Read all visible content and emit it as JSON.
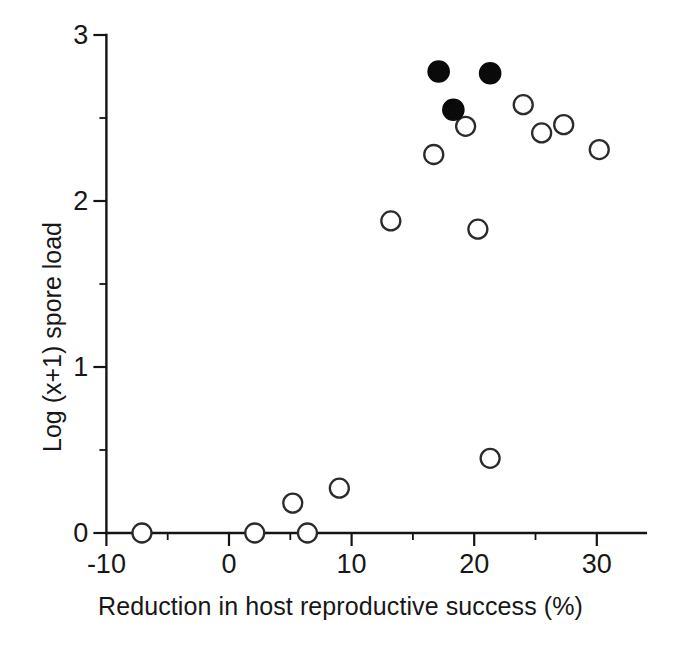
{
  "chart_data": {
    "type": "scatter",
    "title": "",
    "xlabel": "Reduction in host reproductive success (%)",
    "ylabel": "Log (x+1) spore load",
    "xlim": [
      -10,
      34
    ],
    "ylim": [
      0,
      3
    ],
    "xticks": [
      -10,
      0,
      10,
      20,
      30
    ],
    "xtick_labels": [
      "-10",
      "0",
      "10",
      "20",
      "30"
    ],
    "yticks": [
      0,
      1,
      2,
      3
    ],
    "ytick_labels": [
      "0",
      "1",
      "2",
      "3"
    ],
    "x_minor_ticks": [
      -5,
      5,
      15,
      25
    ],
    "y_minor_ticks": [
      0.5,
      1.5,
      2.5
    ],
    "grid": false,
    "legend": "none",
    "series": [
      {
        "name": "open circles",
        "marker": "open-circle",
        "color": "#ffffff",
        "edge_color": "#2b2b2b",
        "points": [
          {
            "x": -7.1,
            "y": 0.0
          },
          {
            "x": 2.1,
            "y": 0.0
          },
          {
            "x": 6.4,
            "y": 0.0
          },
          {
            "x": 5.2,
            "y": 0.18
          },
          {
            "x": 9.0,
            "y": 0.27
          },
          {
            "x": 21.3,
            "y": 0.45
          },
          {
            "x": 13.2,
            "y": 1.88
          },
          {
            "x": 20.3,
            "y": 1.83
          },
          {
            "x": 16.7,
            "y": 2.28
          },
          {
            "x": 19.3,
            "y": 2.45
          },
          {
            "x": 24.0,
            "y": 2.58
          },
          {
            "x": 25.5,
            "y": 2.41
          },
          {
            "x": 27.3,
            "y": 2.46
          },
          {
            "x": 30.2,
            "y": 2.31
          }
        ]
      },
      {
        "name": "filled circles",
        "marker": "filled-circle",
        "color": "#0a0a0a",
        "edge_color": "#0a0a0a",
        "points": [
          {
            "x": 17.1,
            "y": 2.78
          },
          {
            "x": 21.3,
            "y": 2.77
          },
          {
            "x": 18.3,
            "y": 2.55
          }
        ]
      }
    ]
  }
}
